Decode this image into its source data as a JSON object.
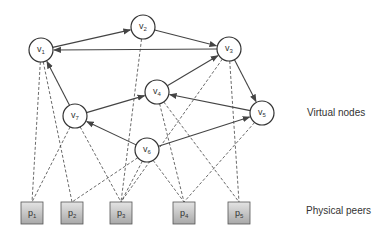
{
  "labels": {
    "virtual_nodes": "Virtual nodes",
    "physical_peers": "Physical peers"
  },
  "colors": {
    "stroke": "#444444",
    "peer_fill_top": "#e4e4e4",
    "peer_fill_bottom": "#a8a8a8",
    "text": "#333333"
  },
  "virtual_nodes": [
    {
      "id": "v1",
      "base": "v",
      "sub": "1",
      "x": 41,
      "y": 50
    },
    {
      "id": "v2",
      "base": "v",
      "sub": "2",
      "x": 143,
      "y": 27
    },
    {
      "id": "v3",
      "base": "v",
      "sub": "3",
      "x": 229,
      "y": 49
    },
    {
      "id": "v4",
      "base": "v",
      "sub": "4",
      "x": 157,
      "y": 92
    },
    {
      "id": "v5",
      "base": "v",
      "sub": "5",
      "x": 262,
      "y": 113
    },
    {
      "id": "v6",
      "base": "v",
      "sub": "6",
      "x": 147,
      "y": 150
    },
    {
      "id": "v7",
      "base": "v",
      "sub": "7",
      "x": 75,
      "y": 116
    }
  ],
  "physical_peers": [
    {
      "id": "p1",
      "base": "p",
      "sub": "1",
      "x": 32,
      "y": 213
    },
    {
      "id": "p2",
      "base": "p",
      "sub": "2",
      "x": 72,
      "y": 213
    },
    {
      "id": "p3",
      "base": "p",
      "sub": "3",
      "x": 121,
      "y": 213
    },
    {
      "id": "p4",
      "base": "p",
      "sub": "4",
      "x": 184,
      "y": 213
    },
    {
      "id": "p5",
      "base": "p",
      "sub": "5",
      "x": 239,
      "y": 213
    }
  ],
  "directed_edges": [
    [
      "v1",
      "v2"
    ],
    [
      "v2",
      "v3"
    ],
    [
      "v3",
      "v1"
    ],
    [
      "v7",
      "v1"
    ],
    [
      "v7",
      "v4"
    ],
    [
      "v4",
      "v3"
    ],
    [
      "v5",
      "v4"
    ],
    [
      "v3",
      "v5"
    ],
    [
      "v6",
      "v7"
    ],
    [
      "v6",
      "v5"
    ]
  ],
  "mapping_edges": [
    [
      "v1",
      "p1"
    ],
    [
      "v1",
      "p2"
    ],
    [
      "v7",
      "p1"
    ],
    [
      "v7",
      "p3"
    ],
    [
      "v2",
      "p3"
    ],
    [
      "v4",
      "p4"
    ],
    [
      "v4",
      "p5"
    ],
    [
      "v3",
      "p3"
    ],
    [
      "v3",
      "p5"
    ],
    [
      "v5",
      "p4"
    ],
    [
      "v6",
      "p2"
    ],
    [
      "v6",
      "p3"
    ],
    [
      "v6",
      "p4"
    ]
  ]
}
